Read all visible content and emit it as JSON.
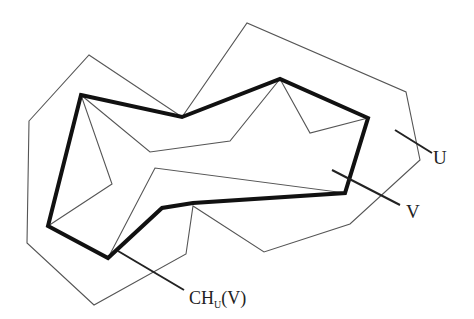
{
  "figure": {
    "colors": {
      "background": "#ffffff",
      "thin_line": "#555555",
      "hull_line": "#111111",
      "leader_line": "#222222",
      "text": "#222222"
    },
    "polygons": {
      "U": {
        "name": "U",
        "points": "29,121 89,55 182,117 247,23 406,92 420,160 350,224 264,252 193,206 186,254 94,305 27,243"
      },
      "V": {
        "name": "V",
        "points": "81,95 150,152 230,141 280,79 310,133 368,118 345,193 155,168 108,258 48,226 112,184"
      },
      "V_extra_edge": "81,95 112,184",
      "hull": {
        "name": "CH_U(V)",
        "points": "81,95 182,117 280,79 368,118 345,193 193,203 162,208 108,258 48,226"
      }
    },
    "labels": {
      "U": {
        "text": "U",
        "x": 433,
        "y": 158,
        "leader": "395,130 432,153"
      },
      "V": {
        "text": "V",
        "x": 407,
        "y": 212,
        "leader": "332,170 400,205"
      },
      "CH": {
        "base": "CH",
        "sub": "U",
        "rest": "(V)",
        "x": 189,
        "y": 300,
        "leader": "118,251 184,290"
      }
    }
  }
}
